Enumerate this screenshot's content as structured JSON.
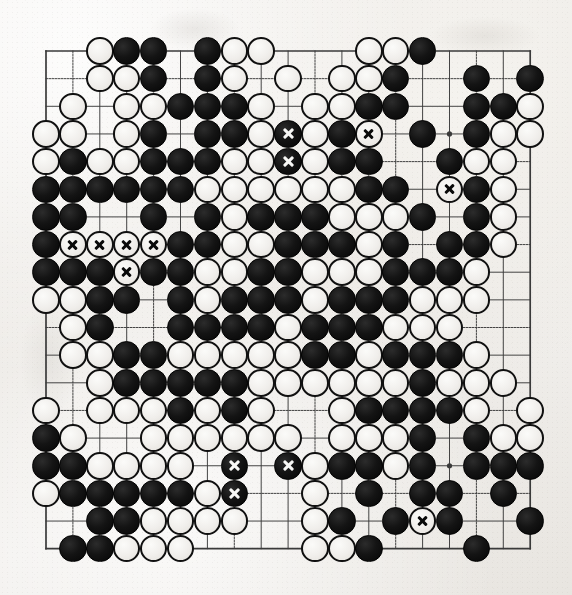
{
  "board": {
    "title": "Go board diagram",
    "size": 19,
    "geometry": {
      "origin_x": 46,
      "origin_y": 51,
      "spacing_x": 26.9,
      "spacing_y": 27.65,
      "stone_diameter": 27.5
    },
    "colors": {
      "paper": "#efedea",
      "line": "#3a3a3a",
      "black_stone": "#0c0c0c",
      "white_stone": "#f2f0ed",
      "white_stone_outline": "#101010",
      "mark_on_black": "#f7f7f5",
      "mark_on_white": "#0a0a0a"
    },
    "star_points": [
      [
        3,
        3
      ],
      [
        9,
        3
      ],
      [
        15,
        3
      ],
      [
        3,
        9
      ],
      [
        9,
        9
      ],
      [
        15,
        9
      ],
      [
        3,
        15
      ],
      [
        9,
        15
      ],
      [
        15,
        15
      ]
    ],
    "legend": {
      "black": "B",
      "white": "W",
      "empty": ".",
      "marked_suffix": "x"
    },
    "rows": [
      "..WBB.BWW...WWB....",
      "..WWB.BW.W.WWB..B.B",
      ".W.WWBBBW.WWBB..BBW",
      "WW.WB.BBWBxWBx.B.BWW",
      "WBWWBBBWWBxWBB.BWW.",
      "BBBBBBWWWWWWBB.WxBW",
      "BB..B.BWBBBWWWB.BW.",
      "BWxWxWxWxBBWWBBBWB.BBW",
      "BBBWxBBWWBBWWWBBBW.",
      "WWBB.BWBBBWBBBWWW..",
      ".WB..BBBBWBBBWWW...",
      ".WWBBWWWWWBBWBBBW..",
      "..WBBBBBWWWWWWBWWW.",
      "W.WWWBWBW..WBBBBW.W",
      "BW..WWWWWW.WWWB.BWW",
      "BBWWWW.Bx.BxWBBWB.BBB",
      ".BBBBBWBx..WB.BB.B.",
      "..BBWWWW..WB.BWxB.B",
      ".BBWWW....WWB...B.."
    ],
    "stone_list_note": "rows[] encode the 19x19 position; 'B'=black, 'W'=white, '.'=empty, a trailing 'x' marker on a stone means that stone carries an X annotation"
  },
  "annotations": {
    "marked_points": [
      {
        "col": 9,
        "row": 3,
        "stone": "black",
        "mark": "x"
      },
      {
        "col": 12,
        "row": 3,
        "stone": "white",
        "mark": "x"
      },
      {
        "col": 9,
        "row": 4,
        "stone": "black",
        "mark": "x"
      },
      {
        "col": 15,
        "row": 5,
        "stone": "white",
        "mark": "x"
      },
      {
        "col": 1,
        "row": 7,
        "stone": "white",
        "mark": "x"
      },
      {
        "col": 2,
        "row": 7,
        "stone": "white",
        "mark": "x"
      },
      {
        "col": 3,
        "row": 7,
        "stone": "white",
        "mark": "x"
      },
      {
        "col": 4,
        "row": 7,
        "stone": "white",
        "mark": "x"
      },
      {
        "col": 3,
        "row": 8,
        "stone": "white",
        "mark": "x"
      },
      {
        "col": 7,
        "row": 15,
        "stone": "black",
        "mark": "x"
      },
      {
        "col": 9,
        "row": 15,
        "stone": "black",
        "mark": "x"
      },
      {
        "col": 7,
        "row": 16,
        "stone": "black",
        "mark": "x"
      },
      {
        "col": 14,
        "row": 17,
        "stone": "white",
        "mark": "x"
      }
    ],
    "count": 13
  },
  "position": {
    "black": [
      [
        3,
        0
      ],
      [
        4,
        0
      ],
      [
        6,
        0
      ],
      [
        14,
        0
      ],
      [
        4,
        1
      ],
      [
        6,
        1
      ],
      [
        13,
        1
      ],
      [
        16,
        1
      ],
      [
        18,
        1
      ],
      [
        5,
        2
      ],
      [
        6,
        2
      ],
      [
        7,
        2
      ],
      [
        12,
        2
      ],
      [
        13,
        2
      ],
      [
        16,
        2
      ],
      [
        17,
        2
      ],
      [
        4,
        3
      ],
      [
        6,
        3
      ],
      [
        7,
        3
      ],
      [
        9,
        3
      ],
      [
        11,
        3
      ],
      [
        14,
        3
      ],
      [
        16,
        3
      ],
      [
        1,
        4
      ],
      [
        4,
        4
      ],
      [
        5,
        4
      ],
      [
        6,
        4
      ],
      [
        9,
        4
      ],
      [
        11,
        4
      ],
      [
        12,
        4
      ],
      [
        15,
        4
      ],
      [
        0,
        5
      ],
      [
        1,
        5
      ],
      [
        2,
        5
      ],
      [
        3,
        5
      ],
      [
        4,
        5
      ],
      [
        5,
        5
      ],
      [
        12,
        5
      ],
      [
        13,
        5
      ],
      [
        16,
        5
      ],
      [
        0,
        6
      ],
      [
        1,
        6
      ],
      [
        4,
        6
      ],
      [
        6,
        6
      ],
      [
        8,
        6
      ],
      [
        9,
        6
      ],
      [
        10,
        6
      ],
      [
        14,
        6
      ],
      [
        16,
        6
      ],
      [
        0,
        7
      ],
      [
        5,
        7
      ],
      [
        6,
        7
      ],
      [
        9,
        7
      ],
      [
        10,
        7
      ],
      [
        11,
        7
      ],
      [
        13,
        7
      ],
      [
        15,
        7
      ],
      [
        16,
        7
      ],
      [
        0,
        8
      ],
      [
        1,
        8
      ],
      [
        2,
        8
      ],
      [
        4,
        8
      ],
      [
        5,
        8
      ],
      [
        8,
        8
      ],
      [
        9,
        8
      ],
      [
        13,
        8
      ],
      [
        14,
        8
      ],
      [
        15,
        8
      ],
      [
        2,
        9
      ],
      [
        3,
        9
      ],
      [
        5,
        9
      ],
      [
        7,
        9
      ],
      [
        8,
        9
      ],
      [
        9,
        9
      ],
      [
        11,
        9
      ],
      [
        12,
        9
      ],
      [
        13,
        9
      ],
      [
        2,
        10
      ],
      [
        5,
        10
      ],
      [
        6,
        10
      ],
      [
        7,
        10
      ],
      [
        8,
        10
      ],
      [
        10,
        10
      ],
      [
        11,
        10
      ],
      [
        12,
        10
      ],
      [
        3,
        11
      ],
      [
        4,
        11
      ],
      [
        10,
        11
      ],
      [
        11,
        11
      ],
      [
        13,
        11
      ],
      [
        14,
        11
      ],
      [
        15,
        11
      ],
      [
        3,
        12
      ],
      [
        4,
        12
      ],
      [
        5,
        12
      ],
      [
        6,
        12
      ],
      [
        7,
        12
      ],
      [
        14,
        12
      ],
      [
        5,
        13
      ],
      [
        7,
        13
      ],
      [
        12,
        13
      ],
      [
        13,
        13
      ],
      [
        14,
        13
      ],
      [
        15,
        13
      ],
      [
        0,
        14
      ],
      [
        14,
        14
      ],
      [
        16,
        14
      ],
      [
        0,
        15
      ],
      [
        1,
        15
      ],
      [
        7,
        15
      ],
      [
        9,
        15
      ],
      [
        11,
        15
      ],
      [
        12,
        15
      ],
      [
        14,
        15
      ],
      [
        16,
        15
      ],
      [
        17,
        15
      ],
      [
        18,
        15
      ],
      [
        1,
        16
      ],
      [
        2,
        16
      ],
      [
        3,
        16
      ],
      [
        4,
        16
      ],
      [
        5,
        16
      ],
      [
        7,
        16
      ],
      [
        12,
        16
      ],
      [
        14,
        16
      ],
      [
        15,
        16
      ],
      [
        17,
        16
      ],
      [
        2,
        17
      ],
      [
        3,
        17
      ],
      [
        11,
        17
      ],
      [
        13,
        17
      ],
      [
        15,
        17
      ],
      [
        18,
        17
      ],
      [
        1,
        18
      ],
      [
        2,
        18
      ],
      [
        12,
        18
      ],
      [
        16,
        18
      ]
    ],
    "white": [
      [
        2,
        0
      ],
      [
        7,
        0
      ],
      [
        8,
        0
      ],
      [
        12,
        0
      ],
      [
        13,
        0
      ],
      [
        2,
        1
      ],
      [
        3,
        1
      ],
      [
        7,
        1
      ],
      [
        9,
        1
      ],
      [
        11,
        1
      ],
      [
        12,
        1
      ],
      [
        1,
        2
      ],
      [
        3,
        2
      ],
      [
        4,
        2
      ],
      [
        8,
        2
      ],
      [
        10,
        2
      ],
      [
        11,
        2
      ],
      [
        18,
        2
      ],
      [
        0,
        3
      ],
      [
        1,
        3
      ],
      [
        3,
        3
      ],
      [
        8,
        3
      ],
      [
        10,
        3
      ],
      [
        12,
        3
      ],
      [
        17,
        3
      ],
      [
        18,
        3
      ],
      [
        0,
        4
      ],
      [
        2,
        4
      ],
      [
        3,
        4
      ],
      [
        7,
        4
      ],
      [
        8,
        4
      ],
      [
        10,
        4
      ],
      [
        16,
        4
      ],
      [
        17,
        4
      ],
      [
        6,
        5
      ],
      [
        7,
        5
      ],
      [
        8,
        5
      ],
      [
        9,
        5
      ],
      [
        10,
        5
      ],
      [
        11,
        5
      ],
      [
        15,
        5
      ],
      [
        17,
        5
      ],
      [
        7,
        6
      ],
      [
        11,
        6
      ],
      [
        12,
        6
      ],
      [
        13,
        6
      ],
      [
        17,
        6
      ],
      [
        1,
        7
      ],
      [
        2,
        7
      ],
      [
        3,
        7
      ],
      [
        4,
        7
      ],
      [
        7,
        7
      ],
      [
        8,
        7
      ],
      [
        12,
        7
      ],
      [
        17,
        7
      ],
      [
        3,
        8
      ],
      [
        6,
        8
      ],
      [
        7,
        8
      ],
      [
        10,
        8
      ],
      [
        11,
        8
      ],
      [
        12,
        8
      ],
      [
        16,
        8
      ],
      [
        0,
        9
      ],
      [
        1,
        9
      ],
      [
        6,
        9
      ],
      [
        10,
        9
      ],
      [
        14,
        9
      ],
      [
        15,
        9
      ],
      [
        16,
        9
      ],
      [
        1,
        10
      ],
      [
        9,
        10
      ],
      [
        13,
        10
      ],
      [
        14,
        10
      ],
      [
        15,
        10
      ],
      [
        1,
        11
      ],
      [
        2,
        11
      ],
      [
        5,
        11
      ],
      [
        6,
        11
      ],
      [
        7,
        11
      ],
      [
        8,
        11
      ],
      [
        9,
        11
      ],
      [
        12,
        11
      ],
      [
        16,
        11
      ],
      [
        2,
        12
      ],
      [
        8,
        12
      ],
      [
        9,
        12
      ],
      [
        10,
        12
      ],
      [
        11,
        12
      ],
      [
        12,
        12
      ],
      [
        13,
        12
      ],
      [
        15,
        12
      ],
      [
        16,
        12
      ],
      [
        17,
        12
      ],
      [
        0,
        13
      ],
      [
        2,
        13
      ],
      [
        3,
        13
      ],
      [
        4,
        13
      ],
      [
        6,
        13
      ],
      [
        8,
        13
      ],
      [
        11,
        13
      ],
      [
        16,
        13
      ],
      [
        18,
        13
      ],
      [
        1,
        14
      ],
      [
        4,
        14
      ],
      [
        5,
        14
      ],
      [
        6,
        14
      ],
      [
        7,
        14
      ],
      [
        8,
        14
      ],
      [
        9,
        14
      ],
      [
        11,
        14
      ],
      [
        12,
        14
      ],
      [
        13,
        14
      ],
      [
        17,
        14
      ],
      [
        18,
        14
      ],
      [
        2,
        15
      ],
      [
        3,
        15
      ],
      [
        4,
        15
      ],
      [
        5,
        15
      ],
      [
        10,
        15
      ],
      [
        13,
        15
      ],
      [
        0,
        16
      ],
      [
        6,
        16
      ],
      [
        10,
        16
      ],
      [
        4,
        17
      ],
      [
        5,
        17
      ],
      [
        6,
        17
      ],
      [
        7,
        17
      ],
      [
        10,
        17
      ],
      [
        14,
        17
      ],
      [
        3,
        18
      ],
      [
        4,
        18
      ],
      [
        5,
        18
      ],
      [
        10,
        18
      ],
      [
        11,
        18
      ]
    ]
  }
}
